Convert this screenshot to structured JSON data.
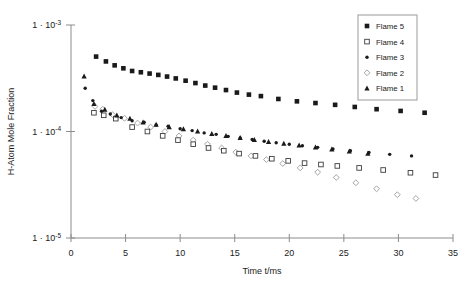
{
  "chart_data": {
    "type": "scatter",
    "title": "",
    "xlabel": "Time t/ms",
    "ylabel": "H-Atom Mole Fraction",
    "xlim": [
      0,
      35
    ],
    "ylim": [
      1e-05,
      0.001
    ],
    "yscale": "log",
    "xscale": "linear",
    "grid": false,
    "legend_position": "top-right",
    "xticks": [
      "0",
      "5",
      "10",
      "15",
      "20",
      "25",
      "30",
      "35"
    ],
    "xtick_values": [
      0,
      5,
      10,
      15,
      20,
      25,
      30,
      35
    ],
    "yticks": [
      "1 · 10-3",
      "1 · 10-4",
      "1 · 10-5"
    ],
    "ytick_mantissa": "1 · 10",
    "ytick_exponents": [
      "-3",
      "-4",
      "-5"
    ],
    "ytick_values": [
      0.001,
      0.0001,
      1e-05
    ],
    "series": [
      {
        "name": "Flame 5",
        "marker": "filled-square",
        "color": "#1a1a1a",
        "points": [
          [
            2.3,
            0.000505
          ],
          [
            3.2,
            0.000455
          ],
          [
            4.0,
            0.000418
          ],
          [
            4.8,
            0.000392
          ],
          [
            5.6,
            0.00037
          ],
          [
            6.4,
            0.00036
          ],
          [
            7.2,
            0.00035
          ],
          [
            8.0,
            0.00034
          ],
          [
            8.8,
            0.000328
          ],
          [
            9.6,
            0.000315
          ],
          [
            10.5,
            0.0003
          ],
          [
            11.4,
            0.000285
          ],
          [
            12.3,
            0.00027
          ],
          [
            13.2,
            0.000258
          ],
          [
            14.2,
            0.000245
          ],
          [
            15.2,
            0.000232
          ],
          [
            16.3,
            0.000222
          ],
          [
            17.4,
            0.000215
          ],
          [
            19.0,
            0.000202
          ],
          [
            20.7,
            0.000192
          ],
          [
            22.4,
            0.000185
          ],
          [
            24.2,
            0.000178
          ],
          [
            26.0,
            0.00017
          ],
          [
            28.0,
            0.000162
          ],
          [
            30.2,
            0.000156
          ],
          [
            32.4,
            0.00015
          ]
        ]
      },
      {
        "name": "Flame 4",
        "marker": "open-square",
        "color": "#3c3c3c",
        "points": [
          [
            2.1,
            0.00015
          ],
          [
            3.0,
            0.000142
          ],
          [
            4.1,
            0.000132
          ],
          [
            5.6,
            0.00011
          ],
          [
            7.0,
            0.0001
          ],
          [
            8.4,
            9.1e-05
          ],
          [
            9.8,
            8.3e-05
          ],
          [
            11.2,
            7.6e-05
          ],
          [
            12.6,
            7e-05
          ],
          [
            14.0,
            6.6e-05
          ],
          [
            15.4,
            6.2e-05
          ],
          [
            16.9,
            5.9e-05
          ],
          [
            18.4,
            5.55e-05
          ],
          [
            19.9,
            5.3e-05
          ],
          [
            21.4,
            5.05e-05
          ],
          [
            22.9,
            4.9e-05
          ],
          [
            24.4,
            4.75e-05
          ],
          [
            26.4,
            4.55e-05
          ],
          [
            28.6,
            4.35e-05
          ],
          [
            31.1,
            4.1e-05
          ],
          [
            33.4,
            3.9e-05
          ]
        ]
      },
      {
        "name": "Flame 3",
        "marker": "small-filled-dot",
        "color": "#1a1a1a",
        "points": [
          [
            1.3,
            0.000255
          ],
          [
            2.0,
            0.000195
          ],
          [
            2.8,
            0.000155
          ],
          [
            3.6,
            0.000146
          ],
          [
            4.6,
            0.000135
          ],
          [
            5.6,
            0.000126
          ],
          [
            6.7,
            0.000122
          ],
          [
            7.8,
            0.000115
          ],
          [
            8.9,
            0.000112
          ],
          [
            10.0,
            0.000106
          ],
          [
            11.1,
            0.000102
          ],
          [
            12.2,
            9.7e-05
          ],
          [
            13.3,
            9.4e-05
          ],
          [
            14.4,
            9e-05
          ],
          [
            15.5,
            8.7e-05
          ],
          [
            16.6,
            8.4e-05
          ],
          [
            17.7,
            8.1e-05
          ],
          [
            18.8,
            7.85e-05
          ],
          [
            20.0,
            7.6e-05
          ],
          [
            21.2,
            7.35e-05
          ],
          [
            22.6,
            7.1e-05
          ],
          [
            24.0,
            6.85e-05
          ],
          [
            25.6,
            6.6e-05
          ],
          [
            27.3,
            6.35e-05
          ],
          [
            29.2,
            6.1e-05
          ],
          [
            31.2,
            5.9e-05
          ]
        ]
      },
      {
        "name": "Flame 2",
        "marker": "open-diamond",
        "color": "#9b9b9b",
        "points": [
          [
            2.2,
            0.000172
          ],
          [
            2.9,
            0.000162
          ],
          [
            3.8,
            0.000144
          ],
          [
            4.9,
            0.000133
          ],
          [
            6.1,
            0.00012
          ],
          [
            7.3,
            0.00011
          ],
          [
            8.6,
            0.0001
          ],
          [
            9.9,
            9.1e-05
          ],
          [
            11.2,
            8.3e-05
          ],
          [
            12.5,
            7.6e-05
          ],
          [
            13.8,
            7e-05
          ],
          [
            15.1,
            6.4e-05
          ],
          [
            16.5,
            5.9e-05
          ],
          [
            17.9,
            5.45e-05
          ],
          [
            19.4,
            5e-05
          ],
          [
            21.0,
            4.55e-05
          ],
          [
            22.6,
            4.15e-05
          ],
          [
            24.3,
            3.7e-05
          ],
          [
            26.1,
            3.3e-05
          ],
          [
            28.0,
            2.9e-05
          ],
          [
            29.9,
            2.55e-05
          ],
          [
            31.6,
            2.35e-05
          ]
        ]
      },
      {
        "name": "Flame 1",
        "marker": "filled-triangle",
        "color": "#1a1a1a",
        "points": [
          [
            1.2,
            0.00033
          ],
          [
            2.1,
            0.000182
          ],
          [
            3.1,
            0.00016
          ],
          [
            4.2,
            0.000142
          ],
          [
            5.4,
            0.000132
          ],
          [
            6.6,
            0.000122
          ],
          [
            7.8,
            0.000116
          ],
          [
            9.0,
            0.00011
          ],
          [
            10.3,
            0.000105
          ],
          [
            11.6,
            0.0001
          ],
          [
            12.9,
            9.5e-05
          ],
          [
            14.2,
            9.1e-05
          ],
          [
            15.5,
            8.7e-05
          ],
          [
            16.8,
            8.35e-05
          ],
          [
            18.1,
            8e-05
          ],
          [
            19.5,
            7.7e-05
          ],
          [
            20.9,
            7.4e-05
          ],
          [
            22.4,
            7.1e-05
          ],
          [
            23.9,
            6.8e-05
          ],
          [
            25.5,
            6.5e-05
          ],
          [
            27.2,
            6.2e-05
          ]
        ]
      }
    ]
  }
}
